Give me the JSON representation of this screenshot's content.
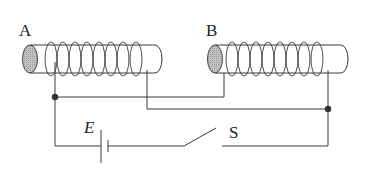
{
  "diagram": {
    "type": "circuit",
    "labels": {
      "coil_a": "A",
      "coil_b": "B",
      "battery": "E",
      "switch": "S"
    },
    "colors": {
      "line": "#3a3a3a",
      "core_end": "#b8b8b8",
      "background": "#ffffff"
    },
    "components": [
      {
        "id": "coil_a",
        "kind": "solenoid",
        "turns": 8
      },
      {
        "id": "coil_b",
        "kind": "solenoid",
        "turns": 8
      },
      {
        "id": "battery",
        "kind": "cell"
      },
      {
        "id": "switch",
        "kind": "switch",
        "state": "open"
      },
      {
        "id": "junction_left",
        "kind": "node"
      },
      {
        "id": "junction_right",
        "kind": "node"
      }
    ]
  }
}
